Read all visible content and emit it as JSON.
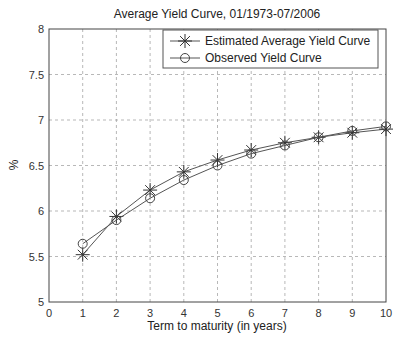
{
  "chart_data": {
    "type": "line",
    "title": "Average Yield Curve, 01/1973-07/2006",
    "xlabel": "Term to maturity (in years)",
    "ylabel": "%",
    "xlim": [
      0,
      10
    ],
    "ylim": [
      5,
      8
    ],
    "xticks": [
      0,
      1,
      2,
      3,
      4,
      5,
      6,
      7,
      8,
      9,
      10
    ],
    "yticks": [
      5,
      5.5,
      6,
      6.5,
      7,
      7.5,
      8
    ],
    "ytick_labels": [
      "5",
      "5.5",
      "6",
      "6.5",
      "7",
      "7.5",
      "8"
    ],
    "grid": true,
    "legend_position": "upper right",
    "x": [
      1,
      2,
      3,
      4,
      5,
      6,
      7,
      8,
      9,
      10
    ],
    "series": [
      {
        "name": "Estimated Average Yield Curve",
        "marker": "star",
        "values": [
          5.52,
          5.94,
          6.23,
          6.43,
          6.56,
          6.67,
          6.75,
          6.81,
          6.86,
          6.9
        ]
      },
      {
        "name": "Observed Yield Curve",
        "marker": "circle",
        "values": [
          5.64,
          5.9,
          6.14,
          6.34,
          6.5,
          6.63,
          6.72,
          6.81,
          6.88,
          6.93
        ]
      }
    ]
  },
  "colors": {
    "line": "#555555",
    "grid": "#999999",
    "frame": "#444444"
  }
}
